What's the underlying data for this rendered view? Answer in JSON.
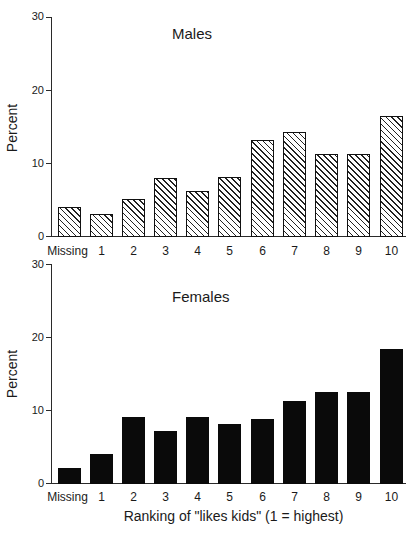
{
  "chart_data": [
    {
      "type": "bar",
      "title": "Males",
      "xlabel": "",
      "ylabel": "Percent",
      "ylim": [
        0,
        30
      ],
      "yticks": [
        0,
        10,
        20,
        30
      ],
      "grid": false,
      "bar_style": "hatched",
      "categories": [
        "Missing",
        "1",
        "2",
        "3",
        "4",
        "5",
        "6",
        "7",
        "8",
        "9",
        "10"
      ],
      "values": [
        4.0,
        3.0,
        5.1,
        8.0,
        6.2,
        8.1,
        13.1,
        14.2,
        11.3,
        11.3,
        16.4
      ]
    },
    {
      "type": "bar",
      "title": "Females",
      "xlabel": "Ranking of \"likes kids\" (1 = highest)",
      "ylabel": "Percent",
      "ylim": [
        0,
        30
      ],
      "yticks": [
        0,
        10,
        20,
        30
      ],
      "grid": false,
      "bar_style": "solid",
      "categories": [
        "Missing",
        "1",
        "2",
        "3",
        "4",
        "5",
        "6",
        "7",
        "8",
        "9",
        "10"
      ],
      "values": [
        2.1,
        4.0,
        9.1,
        7.1,
        9.1,
        8.1,
        8.8,
        11.3,
        12.4,
        12.4,
        18.3
      ]
    }
  ],
  "panels": [
    {
      "title": "Males",
      "ylabel": "Percent",
      "yticks": [
        "30",
        "20",
        "10",
        "0"
      ],
      "categories": [
        "Missing",
        "1",
        "2",
        "3",
        "4",
        "5",
        "6",
        "7",
        "8",
        "9",
        "10"
      ]
    },
    {
      "title": "Females",
      "ylabel": "Percent",
      "yticks": [
        "30",
        "20",
        "10",
        "0"
      ],
      "categories": [
        "Missing",
        "1",
        "2",
        "3",
        "4",
        "5",
        "6",
        "7",
        "8",
        "9",
        "10"
      ],
      "xlabel": "Ranking of \"likes kids\" (1 = highest)"
    }
  ]
}
